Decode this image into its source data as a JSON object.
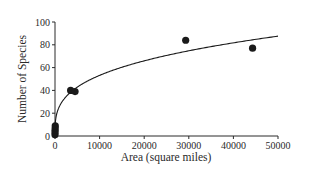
{
  "chart_data": {
    "type": "scatter",
    "title": "",
    "xlabel": "Area (square miles)",
    "ylabel": "Number of Species",
    "xlim": [
      0,
      50000
    ],
    "ylim": [
      0,
      100
    ],
    "xticks": [
      0,
      10000,
      20000,
      30000,
      40000,
      50000
    ],
    "yticks": [
      0,
      20,
      40,
      60,
      80,
      100
    ],
    "grid": false,
    "legend": null,
    "series": [
      {
        "name": "Observed species",
        "kind": "scatter",
        "points": [
          {
            "x": 0,
            "y": 1
          },
          {
            "x": 10,
            "y": 3
          },
          {
            "x": 20,
            "y": 5
          },
          {
            "x": 40,
            "y": 7
          },
          {
            "x": 60,
            "y": 9
          },
          {
            "x": 3500,
            "y": 40
          },
          {
            "x": 4500,
            "y": 39
          },
          {
            "x": 29300,
            "y": 84
          },
          {
            "x": 44300,
            "y": 77
          }
        ]
      },
      {
        "name": "Fitted species-area curve",
        "kind": "line",
        "model": "power",
        "c": 3.06,
        "z": 0.31,
        "x_range": [
          0,
          50000
        ]
      }
    ]
  },
  "colors": {
    "axis": "#2a2a2a",
    "points": "#1a1a1a",
    "curve": "#1a1a1a",
    "background": "#ffffff"
  }
}
